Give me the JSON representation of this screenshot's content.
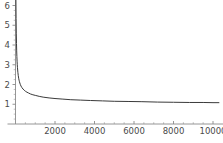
{
  "chart_data": {
    "type": "line",
    "title": "",
    "subtitle": "",
    "xlabel": "",
    "ylabel": "",
    "xlim": [
      0,
      10400
    ],
    "ylim": [
      0,
      6.4
    ],
    "grid": false,
    "legend": null,
    "axis_origin": [
      0,
      0
    ],
    "x_ticks": [
      2000,
      4000,
      6000,
      8000,
      10000
    ],
    "x_tick_labels": [
      "2000",
      "4000",
      "6000",
      "8000",
      "10000"
    ],
    "x_minor_tick_count_between": 3,
    "y_ticks": [
      1,
      2,
      3,
      4,
      5,
      6
    ],
    "y_tick_labels": [
      "1",
      "2",
      "3",
      "4",
      "5",
      "6"
    ],
    "y_minor_tick_count_between": 3,
    "asymptote_y": 1,
    "series": [
      {
        "name": "curve",
        "color": "#3a3a3a",
        "x": [
          20,
          30,
          40,
          50,
          60,
          70,
          80,
          90,
          100,
          120,
          140,
          160,
          180,
          200,
          240,
          280,
          320,
          380,
          440,
          500,
          580,
          660,
          760,
          880,
          1000,
          1200,
          1400,
          1700,
          2000,
          2400,
          2800,
          3300,
          3800,
          4400,
          5000,
          5700,
          6400,
          7200,
          8000,
          8800,
          9500,
          10000,
          10300
        ],
        "y": [
          6.4,
          5.35,
          4.6,
          4.08,
          3.7,
          3.41,
          3.18,
          3.0,
          2.85,
          2.62,
          2.45,
          2.32,
          2.22,
          2.14,
          2.01,
          1.92,
          1.85,
          1.77,
          1.71,
          1.66,
          1.61,
          1.57,
          1.52,
          1.48,
          1.45,
          1.4,
          1.36,
          1.32,
          1.29,
          1.26,
          1.23,
          1.21,
          1.19,
          1.17,
          1.15,
          1.14,
          1.13,
          1.11,
          1.1,
          1.09,
          1.09,
          1.08,
          1.08
        ]
      }
    ]
  },
  "axes": {
    "axis_color": "#8a8a8a",
    "tick_label_color": "#4a4a4a",
    "curve_color": "#3a3a3a",
    "background": "#ffffff"
  }
}
